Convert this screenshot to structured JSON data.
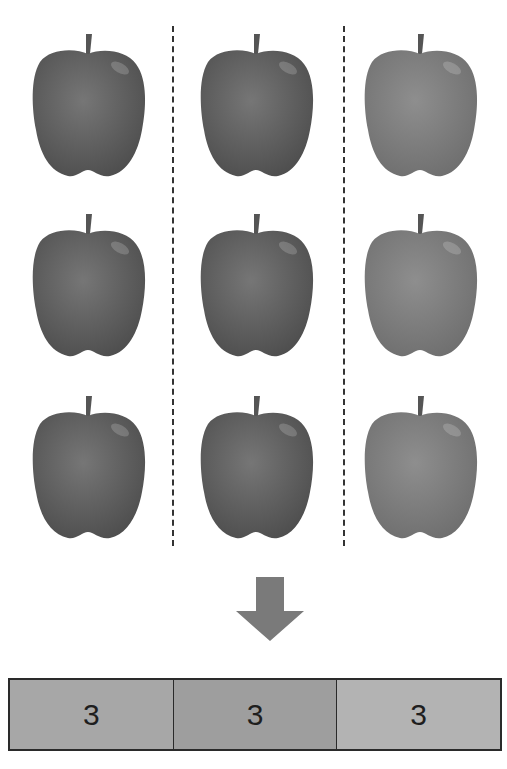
{
  "diagram": {
    "total_items": 9,
    "groups": [
      {
        "label": "3",
        "count": 3,
        "apple_tone": "dark",
        "cell_color": "#a7a7a7"
      },
      {
        "label": "3",
        "count": 3,
        "apple_tone": "dark",
        "cell_color": "#9e9e9e"
      },
      {
        "label": "3",
        "count": 3,
        "apple_tone": "light",
        "cell_color": "#b3b3b3"
      }
    ],
    "colors": {
      "apple_dark": "#4e4e4e",
      "apple_dark_highlight": "#767676",
      "apple_light": "#6f6f6f",
      "apple_light_highlight": "#8e8e8e",
      "stem": "#555555",
      "arrow": "#7a7a7a",
      "border": "#2a2a2a"
    },
    "arrow_icon": "down-arrow"
  }
}
